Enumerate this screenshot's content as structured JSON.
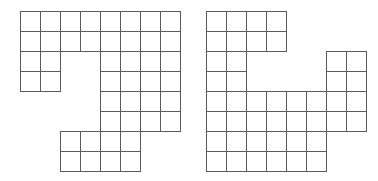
{
  "figure": {
    "background_color": "#ffffff",
    "cell_stroke_color": "#5a5a5a",
    "cell_fill_color": "#ffffff",
    "cell_size_px": 20,
    "stroke_width_px": 1,
    "canvas_width_px": 378,
    "canvas_height_px": 181
  },
  "shapes": [
    {
      "name": "left-shape",
      "label": "Left polyomino",
      "origin_x_px": 20,
      "origin_y_px": 11,
      "columns": 8,
      "rows": 8,
      "cell_count": 40,
      "filled_cells": [
        [
          0,
          0
        ],
        [
          1,
          0
        ],
        [
          2,
          0
        ],
        [
          3,
          0
        ],
        [
          4,
          0
        ],
        [
          5,
          0
        ],
        [
          6,
          0
        ],
        [
          7,
          0
        ],
        [
          0,
          1
        ],
        [
          1,
          1
        ],
        [
          2,
          1
        ],
        [
          3,
          1
        ],
        [
          4,
          1
        ],
        [
          5,
          1
        ],
        [
          6,
          1
        ],
        [
          7,
          1
        ],
        [
          0,
          2
        ],
        [
          1,
          2
        ],
        [
          4,
          2
        ],
        [
          5,
          2
        ],
        [
          6,
          2
        ],
        [
          7,
          2
        ],
        [
          0,
          3
        ],
        [
          1,
          3
        ],
        [
          4,
          3
        ],
        [
          5,
          3
        ],
        [
          6,
          3
        ],
        [
          7,
          3
        ],
        [
          4,
          4
        ],
        [
          5,
          4
        ],
        [
          6,
          4
        ],
        [
          7,
          4
        ],
        [
          4,
          5
        ],
        [
          5,
          5
        ],
        [
          6,
          5
        ],
        [
          7,
          5
        ],
        [
          2,
          6
        ],
        [
          3,
          6
        ],
        [
          4,
          6
        ],
        [
          5,
          6
        ],
        [
          2,
          7
        ],
        [
          3,
          7
        ],
        [
          4,
          7
        ],
        [
          5,
          7
        ]
      ]
    },
    {
      "name": "right-shape",
      "label": "Right polyomino",
      "origin_x_px": 206,
      "origin_y_px": 11,
      "columns": 8,
      "rows": 8,
      "cell_count": 40,
      "filled_cells": [
        [
          0,
          0
        ],
        [
          1,
          0
        ],
        [
          2,
          0
        ],
        [
          3,
          0
        ],
        [
          0,
          1
        ],
        [
          1,
          1
        ],
        [
          2,
          1
        ],
        [
          3,
          1
        ],
        [
          0,
          2
        ],
        [
          1,
          2
        ],
        [
          6,
          2
        ],
        [
          7,
          2
        ],
        [
          0,
          3
        ],
        [
          1,
          3
        ],
        [
          6,
          3
        ],
        [
          7,
          3
        ],
        [
          0,
          4
        ],
        [
          1,
          4
        ],
        [
          2,
          4
        ],
        [
          3,
          4
        ],
        [
          4,
          4
        ],
        [
          5,
          4
        ],
        [
          6,
          4
        ],
        [
          7,
          4
        ],
        [
          0,
          5
        ],
        [
          1,
          5
        ],
        [
          2,
          5
        ],
        [
          3,
          5
        ],
        [
          4,
          5
        ],
        [
          5,
          5
        ],
        [
          6,
          5
        ],
        [
          7,
          5
        ],
        [
          0,
          6
        ],
        [
          1,
          6
        ],
        [
          2,
          6
        ],
        [
          3,
          6
        ],
        [
          4,
          6
        ],
        [
          5,
          6
        ],
        [
          0,
          7
        ],
        [
          1,
          7
        ],
        [
          2,
          7
        ],
        [
          3,
          7
        ],
        [
          4,
          7
        ],
        [
          5,
          7
        ]
      ]
    }
  ]
}
